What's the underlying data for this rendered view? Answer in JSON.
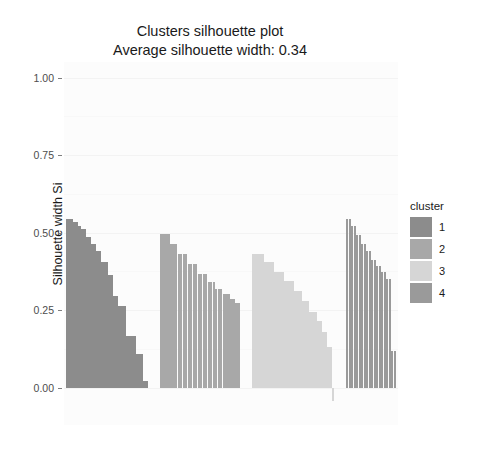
{
  "chart_data": {
    "type": "bar",
    "title": "Clusters silhouette plot",
    "subtitle": "Average silhouette width: 0.34",
    "xlabel": "",
    "ylabel": "Silhouette width Si",
    "ylim": [
      -0.12,
      1.05
    ],
    "ytick_values": [
      0.0,
      0.25,
      0.5,
      0.75,
      1.0
    ],
    "ytick_labels": [
      "0.00",
      "0.25",
      "0.50",
      "0.75",
      "1.00"
    ],
    "grid": true,
    "legend_position": "right",
    "legend_title": "cluster",
    "average_silhouette_width": 0.34,
    "series": [
      {
        "name": "1",
        "cluster": 1,
        "color": "#8c8c8c",
        "values": [
          0.545,
          0.545,
          0.545,
          0.533,
          0.533,
          0.521,
          0.512,
          0.512,
          0.485,
          0.485,
          0.462,
          0.462,
          0.441,
          0.441,
          0.406,
          0.406,
          0.406,
          0.362,
          0.362,
          0.297,
          0.297,
          0.262,
          0.262,
          0.262,
          0.168,
          0.168,
          0.168,
          0.168,
          0.108,
          0.108,
          0.108,
          0.021,
          0.021
        ]
      },
      {
        "name": "2",
        "cluster": 2,
        "color": "#a8a8a8",
        "values": [
          0.495,
          0.495,
          0.495,
          0.495,
          0.462,
          0.462,
          0.462,
          0.432,
          0.432,
          0.432,
          0.432,
          0.398,
          0.398,
          0.398,
          0.398,
          0.366,
          0.366,
          0.366,
          0.366,
          0.34,
          0.34,
          0.34,
          0.317,
          0.317,
          0.317,
          0.301,
          0.301,
          0.301,
          0.286,
          0.286,
          0.272,
          0.272
        ]
      },
      {
        "name": "3",
        "cluster": 3,
        "color": "#d6d6d6",
        "values": [
          0.431,
          0.431,
          0.431,
          0.431,
          0.431,
          0.404,
          0.404,
          0.404,
          0.404,
          0.372,
          0.372,
          0.372,
          0.372,
          0.345,
          0.345,
          0.345,
          0.345,
          0.311,
          0.311,
          0.311,
          0.281,
          0.281,
          0.281,
          0.245,
          0.245,
          0.245,
          0.214,
          0.214,
          0.181,
          0.181,
          0.132,
          0.132,
          -0.042
        ]
      },
      {
        "name": "4",
        "cluster": 4,
        "color": "#9a9a9a",
        "values": [
          0.545,
          0.545,
          0.521,
          0.521,
          0.492,
          0.492,
          0.462,
          0.462,
          0.441,
          0.441,
          0.412,
          0.412,
          0.392,
          0.392,
          0.372,
          0.372,
          0.352,
          0.352,
          0.118,
          0.118
        ]
      }
    ]
  },
  "legend": {
    "title": "cluster",
    "items": [
      {
        "label": "1",
        "color": "#8c8c8c"
      },
      {
        "label": "2",
        "color": "#a8a8a8"
      },
      {
        "label": "3",
        "color": "#d6d6d6"
      },
      {
        "label": "4",
        "color": "#9a9a9a"
      }
    ]
  },
  "axis": {
    "y_title": "Silhouette width Si",
    "y_labels": [
      "1.00",
      "0.75",
      "0.50",
      "0.25",
      "0.00"
    ]
  },
  "header": {
    "title": "Clusters silhouette plot",
    "subtitle": "Average silhouette width: 0.34"
  },
  "colors": {
    "panel_background": "#fcfcfc",
    "grid": "#f3f3f3",
    "text": "#1a1a1a",
    "axis_text": "#4d4d4d"
  }
}
